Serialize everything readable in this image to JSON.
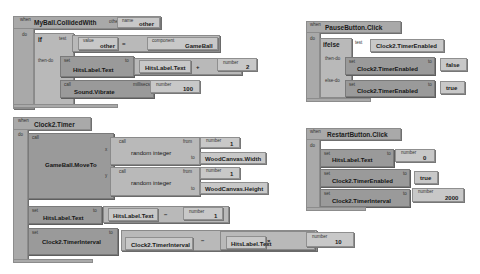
{
  "blocks": {
    "collided": {
      "event_label": "when",
      "title": "MyBall.CollidedWith",
      "param_label": "other",
      "param_name_label": "name",
      "param_name": "other",
      "do_label": "do",
      "if_label": "if",
      "test_label": "test",
      "then_label": "then-do",
      "value_label": "value",
      "value_name": "other",
      "eq_op": "=",
      "component_label": "component",
      "component_name": "GameBall",
      "set_label": "set",
      "set_target": "HitsLabel.Text",
      "to_label": "to",
      "add_left": "HitsLabel.Text",
      "add_op": "+",
      "number_label": "number",
      "add_right": "2",
      "call_label": "call",
      "call_name": "Sound.Vibrate",
      "millisecs_label": "millisecs",
      "vibrate_ms": "100"
    },
    "pause": {
      "event_label": "when",
      "title": "PauseButton.Click",
      "do_label": "do",
      "ifelse_label": "ifelse",
      "test_label": "test",
      "test_value": "Clock2.TimerEnabled",
      "then_label": "then-do",
      "else_label": "else-do",
      "set_label": "set",
      "to_label": "to",
      "then_target": "Clock2.TimerEnabled",
      "then_value": "false",
      "else_target": "Clock2.TimerEnabled",
      "else_value": "true"
    },
    "timer": {
      "event_label": "when",
      "title": "Clock2.Timer",
      "do_label": "do",
      "call_label": "call",
      "call_name": "GameBall.MoveTo",
      "x_label": "x",
      "y_label": "y",
      "rand_label": "random integer",
      "from_label": "from",
      "to_label": "to",
      "number_label": "number",
      "x_from": "1",
      "x_to": "WoodCanvas.Width",
      "y_from": "1",
      "y_to": "WoodCanvas.Height",
      "set_label": "set",
      "set1_target": "HitsLabel.Text",
      "set1_left": "HitsLabel.Text",
      "set1_op": "−",
      "set1_right": "1",
      "set2_target": "Clock2.TimerInterval",
      "set2_left": "Clock2.TimerInterval",
      "set2_op": "−",
      "set2_mul_left": "HitsLabel.Text",
      "set2_mul_op": "×",
      "set2_mul_right": "10"
    },
    "restart": {
      "event_label": "when",
      "title": "RestartButton.Click",
      "do_label": "do",
      "set_label": "set",
      "to_label": "to",
      "number_label": "number",
      "s1_target": "HitsLabel.Text",
      "s1_value": "0",
      "s2_target": "Clock2.TimerEnabled",
      "s2_value": "true",
      "s3_target": "Clock2.TimerInterval",
      "s3_value": "2000"
    }
  }
}
